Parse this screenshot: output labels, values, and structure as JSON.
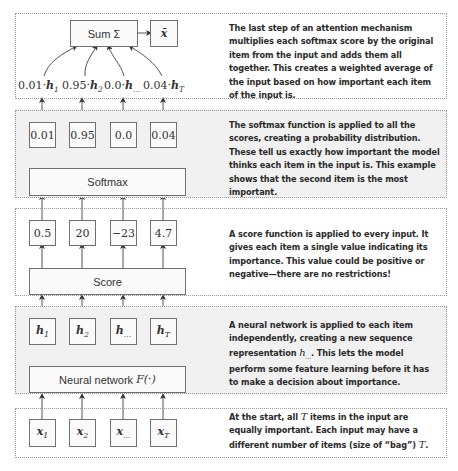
{
  "diagram": {
    "colors": {
      "panel_grey": "#f1f1f1",
      "border": "#707070",
      "text": "#2a2a2a"
    },
    "stages": [
      {
        "id": "output",
        "sum_label": "Sum Σ",
        "output_label": "x̄",
        "weighted_terms": [
          {
            "weight": "0.01",
            "var": "h",
            "sub": "1"
          },
          {
            "weight": "0.95",
            "var": "h",
            "sub": "2"
          },
          {
            "weight": "0.0",
            "var": "h",
            "sub": "..."
          },
          {
            "weight": "0.04",
            "var": "h",
            "sub": "T"
          }
        ],
        "description": "The last step of an attention mechanism multiplies each softmax score by the original item from the input and adds them all together. This creates a weighted average of the input based on how important each item of the input is."
      },
      {
        "id": "softmax",
        "layer_label": "Softmax",
        "values": [
          "0.01",
          "0.95",
          "0.0",
          "0.04"
        ],
        "description": "The softmax function is applied to all the scores, creating a probability distribution. These tell us exactly how important the model thinks each item in the input is. This example shows that the second item is the most important."
      },
      {
        "id": "score",
        "layer_label": "Score",
        "values": [
          "0.5",
          "20",
          "−23",
          "4.7"
        ],
        "description": "A score function is applied to every input. It gives each item a single value indicating its importance. This value could be positive or negative—there are no restrictions!"
      },
      {
        "id": "neural-network",
        "layer_label": "Neural network F(·)",
        "layer_label_text": "Neural network ",
        "layer_label_math": "F(·)",
        "values": [
          {
            "var": "h",
            "sub": "1"
          },
          {
            "var": "h",
            "sub": "2"
          },
          {
            "var": "h",
            "sub": "..."
          },
          {
            "var": "h",
            "sub": "T"
          }
        ],
        "description_parts": [
          "A neural network is applied to each item independently, creating a new sequence representation ",
          "h",
          "...",
          ". This lets the model perform some feature learning before it has to make a decision about importance."
        ]
      },
      {
        "id": "input",
        "values": [
          {
            "var": "x",
            "sub": "1"
          },
          {
            "var": "x",
            "sub": "2"
          },
          {
            "var": "x",
            "sub": "..."
          },
          {
            "var": "x",
            "sub": "T"
          }
        ],
        "description_parts": [
          "At the start, all ",
          "T",
          " items in the input are equally important. Each input may have a different number of items (size of “bag”) ",
          "T",
          "."
        ]
      }
    ]
  }
}
